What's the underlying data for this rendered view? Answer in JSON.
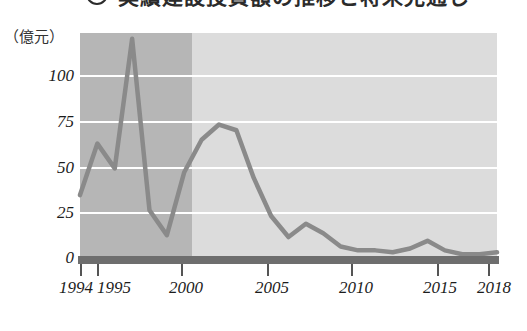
{
  "title": {
    "marker": "3",
    "text": "実績建設投資額の推移と将来見通し",
    "visible_partial": true
  },
  "axis": {
    "unit_label": "（億元）",
    "y_ticks": [
      "0",
      "25",
      "50",
      "75",
      "100"
    ],
    "y_tick_values": [
      0,
      25,
      50,
      75,
      100
    ],
    "x_ticks": [
      "1994",
      "1995",
      "2000",
      "2005",
      "2010",
      "2015",
      "2018"
    ],
    "x_tick_values": [
      1994,
      1995,
      2000,
      2005,
      2010,
      2015,
      2018
    ]
  },
  "colors": {
    "line": "#8a8a8a",
    "band_early": "#b6b6b6",
    "band_late": "#dcdcdc",
    "gridline": "#ffffff",
    "axis_bar": "#6e6e6e",
    "text": "#1c1c1c"
  },
  "chart_data": {
    "type": "line",
    "title": "実績建設投資額の推移と将来見通し",
    "xlabel": "",
    "ylabel": "億元",
    "xlim": [
      1994,
      2018
    ],
    "ylim": [
      0,
      118
    ],
    "grid": true,
    "legend": "none",
    "x": [
      1994,
      1995,
      1996,
      1997,
      1998,
      1999,
      2000,
      2001,
      2002,
      2003,
      2004,
      2005,
      2006,
      2007,
      2008,
      2009,
      2010,
      2011,
      2012,
      2013,
      2014,
      2015,
      2016,
      2017,
      2018
    ],
    "values": [
      33,
      60,
      47,
      115,
      25,
      12,
      45,
      62,
      70,
      67,
      42,
      22,
      11,
      18,
      13,
      6,
      4,
      4,
      3,
      5,
      9,
      4,
      2,
      2,
      3
    ],
    "series": [
      {
        "name": "建設投資額",
        "values": [
          33,
          60,
          47,
          115,
          25,
          12,
          45,
          62,
          70,
          67,
          42,
          22,
          11,
          18,
          13,
          6,
          4,
          4,
          3,
          5,
          9,
          4,
          2,
          2,
          3
        ]
      }
    ],
    "annotations": [
      {
        "label": "濃色背景区間",
        "x_start": 1994,
        "x_end": 2000
      },
      {
        "label": "淡色背景区間",
        "x_start": 2000,
        "x_end": 2018
      }
    ]
  }
}
